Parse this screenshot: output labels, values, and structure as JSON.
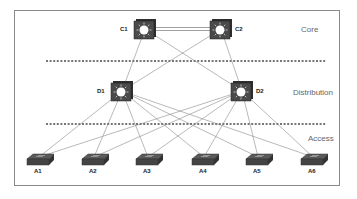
{
  "diagram": {
    "type": "hierarchical-network-topology",
    "layers": [
      {
        "id": "core",
        "label": "Core"
      },
      {
        "id": "distribution",
        "label": "Distribution"
      },
      {
        "id": "access",
        "label": "Access"
      }
    ],
    "nodes": [
      {
        "id": "C1",
        "label": "C1",
        "type": "multilayer-switch",
        "layer": "core",
        "x": 145,
        "y": 29
      },
      {
        "id": "C2",
        "label": "C2",
        "type": "multilayer-switch",
        "layer": "core",
        "x": 221,
        "y": 29
      },
      {
        "id": "D1",
        "label": "D1",
        "type": "multilayer-switch",
        "layer": "distribution",
        "x": 122,
        "y": 91
      },
      {
        "id": "D2",
        "label": "D2",
        "type": "multilayer-switch",
        "layer": "distribution",
        "x": 242,
        "y": 91
      },
      {
        "id": "A1",
        "label": "A1",
        "type": "switch",
        "layer": "access",
        "x": 39,
        "y": 165
      },
      {
        "id": "A2",
        "label": "A2",
        "type": "switch",
        "layer": "access",
        "x": 94,
        "y": 165
      },
      {
        "id": "A3",
        "label": "A3",
        "type": "switch",
        "layer": "access",
        "x": 148,
        "y": 165
      },
      {
        "id": "A4",
        "label": "A4",
        "type": "switch",
        "layer": "access",
        "x": 204,
        "y": 165
      },
      {
        "id": "A5",
        "label": "A5",
        "type": "switch",
        "layer": "access",
        "x": 258,
        "y": 165
      },
      {
        "id": "A6",
        "label": "A6",
        "type": "switch",
        "layer": "access",
        "x": 313,
        "y": 165
      }
    ],
    "links": [
      {
        "from": "C1",
        "to": "C2",
        "style": "double"
      },
      {
        "from": "C1",
        "to": "D1"
      },
      {
        "from": "C1",
        "to": "D2"
      },
      {
        "from": "C2",
        "to": "D1"
      },
      {
        "from": "C2",
        "to": "D2"
      },
      {
        "from": "D1",
        "to": "A1"
      },
      {
        "from": "D1",
        "to": "A2"
      },
      {
        "from": "D1",
        "to": "A3"
      },
      {
        "from": "D1",
        "to": "A4"
      },
      {
        "from": "D1",
        "to": "A5"
      },
      {
        "from": "D1",
        "to": "A6"
      },
      {
        "from": "D2",
        "to": "A1"
      },
      {
        "from": "D2",
        "to": "A2"
      },
      {
        "from": "D2",
        "to": "A3"
      },
      {
        "from": "D2",
        "to": "A4"
      },
      {
        "from": "D2",
        "to": "A5"
      },
      {
        "from": "D2",
        "to": "A6"
      }
    ],
    "separators_y": [
      61,
      124
    ]
  }
}
